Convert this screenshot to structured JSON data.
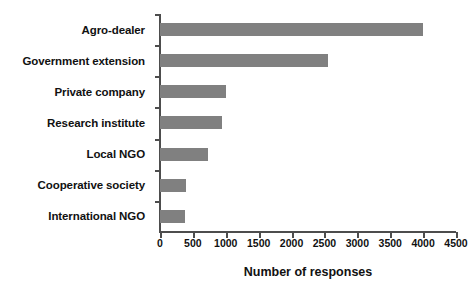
{
  "chart_data": {
    "type": "bar",
    "orientation": "horizontal",
    "title": "",
    "subtitle": "",
    "xlabel": "Number of responses",
    "ylabel": "",
    "categories": [
      "Agro-dealer",
      "Government extension",
      "Private company",
      "Research institute",
      "Local NGO",
      "Cooperative society",
      "International NGO"
    ],
    "values": [
      4000,
      2550,
      1000,
      950,
      730,
      390,
      380
    ],
    "xlim": [
      0,
      4500
    ],
    "xticks": [
      0,
      500,
      1000,
      1500,
      2000,
      2500,
      3000,
      3500,
      4000,
      4500
    ],
    "xtick_labels": [
      "0",
      "500",
      "1000",
      "1500",
      "2000",
      "2500",
      "3000",
      "3500",
      "4000",
      "4500"
    ],
    "grid": false,
    "legend": null,
    "legend_position": "none",
    "bar_color": "#808080",
    "axis_color": "#4d4d4d",
    "background_color": "#ffffff",
    "annotations": []
  }
}
